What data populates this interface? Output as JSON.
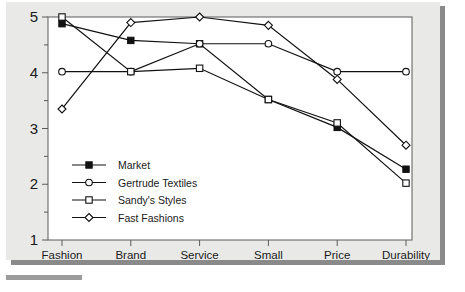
{
  "chart_data": {
    "type": "line",
    "title": "",
    "subtitle": "",
    "xlabel": "",
    "ylabel": "",
    "categories": [
      "Fashion",
      "Brand",
      "Service",
      "Small deliveries",
      "Price",
      "Durability"
    ],
    "category_labels_wrapped": [
      [
        "Fashion"
      ],
      [
        "Brand"
      ],
      [
        "Service"
      ],
      [
        "Small",
        "deliveries"
      ],
      [
        "Price"
      ],
      [
        "Durability"
      ]
    ],
    "ylim": [
      1,
      5
    ],
    "ytick_labels": [
      "1",
      "2",
      "3",
      "4",
      "5"
    ],
    "ytick_values": [
      1,
      2,
      3,
      4,
      5
    ],
    "yminor_values": [
      1.5,
      2.5,
      3.5,
      4.5
    ],
    "grid": false,
    "legend_position": "inside lower-left",
    "series": [
      {
        "name": "Market",
        "marker": "filled-square",
        "values": [
          4.88,
          4.58,
          4.52,
          3.52,
          3.02,
          2.27
        ]
      },
      {
        "name": "Gertrude Textiles",
        "marker": "open-circle",
        "values": [
          4.02,
          4.02,
          4.52,
          4.52,
          4.02,
          4.02
        ]
      },
      {
        "name": "Sandy's Styles",
        "marker": "open-square",
        "values": [
          5.0,
          4.02,
          4.08,
          3.52,
          3.1,
          2.02
        ]
      },
      {
        "name": "Fast Fashions",
        "marker": "open-diamond",
        "values": [
          3.35,
          4.9,
          5.0,
          4.85,
          3.88,
          2.7
        ]
      }
    ]
  },
  "colors": {
    "page_background": "#e9e9e7",
    "plot_background": "#ffffff",
    "line": "#111111",
    "frame": "#5a5a5a",
    "shadow": "#8a8a8a",
    "text": "#1a1a1a"
  }
}
